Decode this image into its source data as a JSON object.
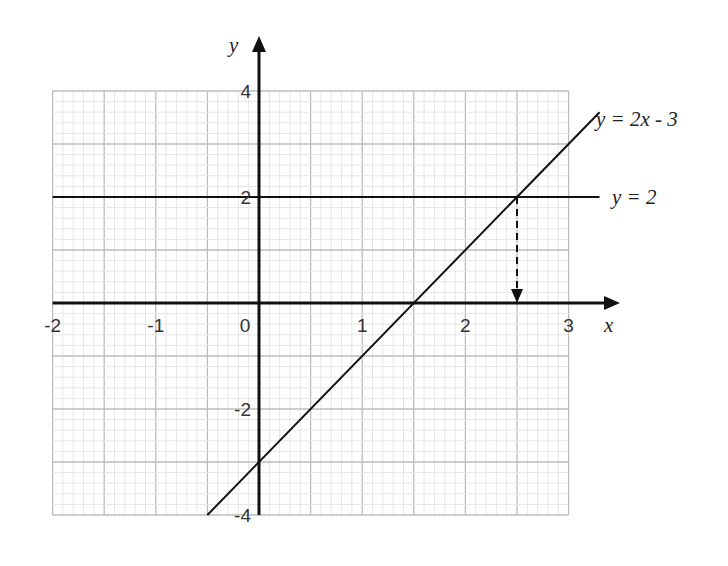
{
  "chart_data": {
    "type": "line",
    "title": "",
    "xlabel": "x",
    "ylabel": "y",
    "xlim": [
      -2,
      3
    ],
    "ylim": [
      -4,
      4
    ],
    "x_ticks": [
      "-2",
      "-1",
      "0",
      "1",
      "2",
      "3"
    ],
    "y_ticks": [
      "4",
      "2",
      "-2",
      "-4"
    ],
    "grid": true,
    "series": [
      {
        "name": "y = 2x - 3",
        "x": [
          -0.5,
          3.3
        ],
        "y": [
          -4,
          3.6
        ]
      },
      {
        "name": "y = 2",
        "x": [
          -2,
          3.3
        ],
        "y": [
          2,
          2
        ]
      }
    ],
    "annotations": [
      {
        "type": "dashed-arrow",
        "from": [
          2.5,
          2
        ],
        "to": [
          2.5,
          0
        ],
        "text": ""
      }
    ],
    "labels": {
      "line1": "y = 2x - 3",
      "line2": "y = 2"
    }
  }
}
